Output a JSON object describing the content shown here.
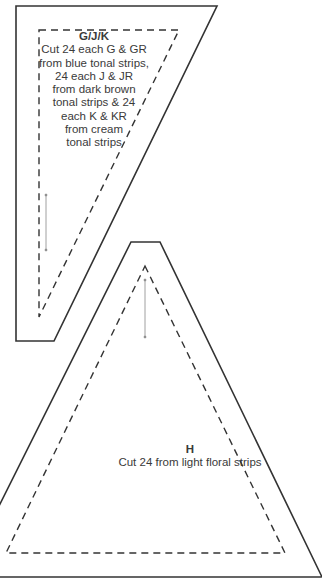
{
  "templates": [
    {
      "id": "G/J/K",
      "title": "G/J/K",
      "instructions": [
        "Cut 24 each G & GR",
        "from blue tonal strips,",
        "24 each J & JR",
        "from dark brown",
        "tonal strips & 24",
        "each K & KR",
        "from cream",
        "tonal strips"
      ],
      "grain_arrow": "vertical"
    },
    {
      "id": "H",
      "title": "H",
      "instructions": [
        "Cut 24 from light floral strips"
      ],
      "grain_arrow": "vertical"
    }
  ],
  "colors": {
    "line": "#333333",
    "arrow": "#888888"
  }
}
